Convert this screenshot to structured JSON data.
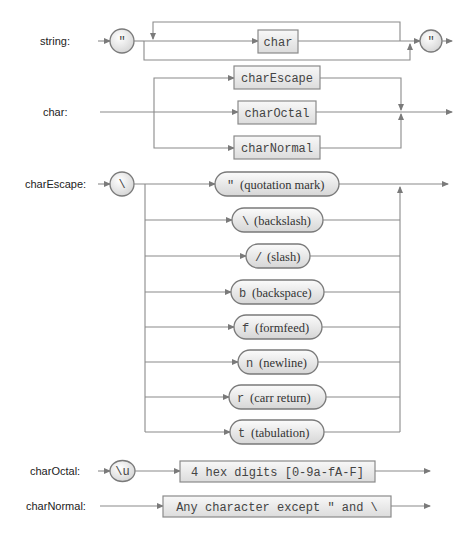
{
  "colors": {
    "line": "#8a8a8a",
    "box_fill_top": "#f7f7f7",
    "box_fill_bottom": "#dedede",
    "text": "#222222"
  },
  "rules": {
    "string": {
      "label": "string:",
      "open_quote": "\"",
      "loop_item": "char",
      "close_quote": "\""
    },
    "char": {
      "label": "char:",
      "alternatives": [
        "charEscape",
        "charOctal",
        "charNormal"
      ]
    },
    "charEscape": {
      "label": "charEscape:",
      "prefix": "\\",
      "alternatives": [
        {
          "code": "\"",
          "desc": "(quotation mark)"
        },
        {
          "code": "\\",
          "desc": "(backslash)"
        },
        {
          "code": "/",
          "desc": "(slash)"
        },
        {
          "code": "b",
          "desc": "(backspace)"
        },
        {
          "code": "f",
          "desc": "(formfeed)"
        },
        {
          "code": "n",
          "desc": "(newline)"
        },
        {
          "code": "r",
          "desc": "(carr return)"
        },
        {
          "code": "t",
          "desc": "(tabulation)"
        }
      ]
    },
    "charOctal": {
      "label": "charOctal:",
      "prefix": "\\u",
      "item": "4 hex digits [0-9a-fA-F]"
    },
    "charNormal": {
      "label": "charNormal:",
      "item": "Any character except \" and \\"
    }
  }
}
